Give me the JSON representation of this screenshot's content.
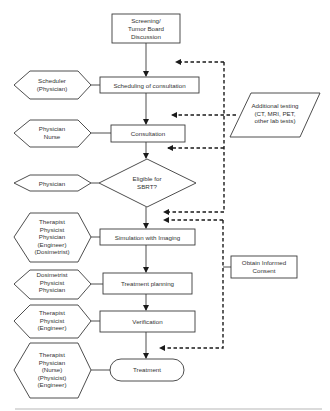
{
  "diagram": {
    "type": "flowchart",
    "process_steps": [
      {
        "id": "screening",
        "lines": [
          "Screening/",
          "Tumor  Board",
          "Discussion"
        ]
      },
      {
        "id": "scheduling",
        "lines": [
          "Scheduling of consultation"
        ]
      },
      {
        "id": "consultation",
        "lines": [
          "Consultation"
        ]
      },
      {
        "id": "eligible",
        "lines": [
          "Eligible for",
          "SBRT?"
        ]
      },
      {
        "id": "simulation",
        "lines": [
          "Simulation with Imaging"
        ]
      },
      {
        "id": "planning",
        "lines": [
          "Treatment planning"
        ]
      },
      {
        "id": "verification",
        "lines": [
          "Verification"
        ]
      },
      {
        "id": "treatment",
        "lines": [
          "Treatment"
        ]
      }
    ],
    "roles": [
      {
        "step": "scheduling",
        "lines": [
          "Scheduler",
          "(Physician)"
        ]
      },
      {
        "step": "consultation",
        "lines": [
          "Physician",
          "Nurse"
        ]
      },
      {
        "step": "eligible",
        "lines": [
          "Physician"
        ]
      },
      {
        "step": "simulation",
        "lines": [
          "Therapist",
          "Physicist",
          "Physician",
          "(Engineer)",
          "(Dosimetrist)"
        ]
      },
      {
        "step": "planning",
        "lines": [
          "Dosimetrist",
          "Physicist",
          "Physician"
        ]
      },
      {
        "step": "verification",
        "lines": [
          "Therapist",
          "Physicist",
          "(Engineer)"
        ]
      },
      {
        "step": "treatment",
        "lines": [
          "Therapist",
          "Physician",
          "(Nurse)",
          "(Physicist)",
          "(Engineer)"
        ]
      }
    ],
    "side_inputs": [
      {
        "id": "additional_testing",
        "lines": [
          "Additional testing",
          "(CT, MRI, PET,",
          "other lab tests)"
        ]
      },
      {
        "id": "informed_consent",
        "lines": [
          "Obtain Informed",
          "Consent"
        ]
      }
    ]
  }
}
